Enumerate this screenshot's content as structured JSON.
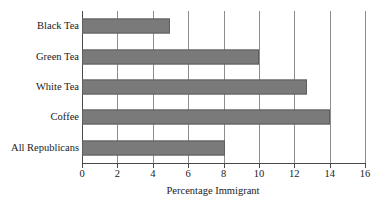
{
  "chart_data": {
    "type": "bar",
    "orientation": "horizontal",
    "title": "",
    "xlabel": "Percentage Immigrant",
    "ylabel": "",
    "categories": [
      "Black Tea",
      "Green Tea",
      "White Tea",
      "Coffee",
      "All Republicans"
    ],
    "values": [
      5.0,
      10.0,
      12.7,
      14.0,
      8.1
    ],
    "xlim": [
      0,
      16
    ],
    "xticks": [
      0,
      2,
      4,
      6,
      8,
      10,
      12,
      14,
      16
    ],
    "xtick_labels": [
      "0",
      "2",
      "4",
      "6",
      "8",
      "10",
      "12",
      "14",
      "16"
    ],
    "grid": "vertical",
    "legend": "none",
    "series": [
      {
        "name": "Percentage Immigrant",
        "values": [
          5.0,
          10.0,
          12.7,
          14.0,
          8.1
        ]
      }
    ],
    "colors": {
      "bar_fill": "#7a7a7a",
      "bar_edge": "#5e5e5e",
      "gridline": "#8d8d8d",
      "axis": "#4a4a4a",
      "background": "#ffffff",
      "text": "#1a1a1a"
    }
  }
}
